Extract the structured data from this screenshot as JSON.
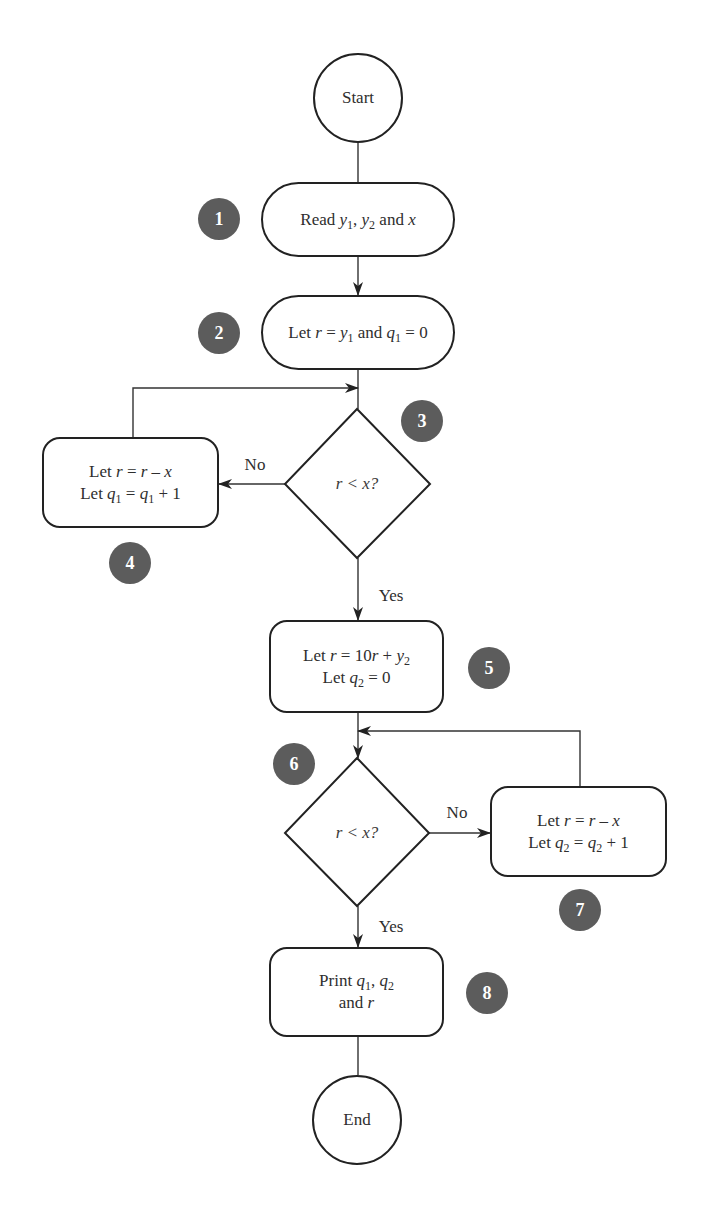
{
  "diagram": {
    "type": "flowchart",
    "colors": {
      "stroke": "#222222",
      "badge_fill": "#5c5c5c",
      "badge_text": "#ffffff",
      "text": "#2e2e2e"
    },
    "terminals": {
      "start": "Start",
      "end": "End"
    },
    "steps": {
      "s1": {
        "badge": "1",
        "prefix": "Read ",
        "v1": "y",
        "v1_sub": "1",
        "sep": ", ",
        "v2": "y",
        "v2_sub": "2",
        "suffix": " and ",
        "v3": "x"
      },
      "s2": {
        "badge": "2",
        "prefix": "Let ",
        "v1": "r",
        "eq": " = ",
        "v2": "y",
        "v2_sub": "1",
        "mid": " and ",
        "v3": "q",
        "v3_sub": "1",
        "suffix": " = 0"
      },
      "s3": {
        "badge": "3",
        "condition": "r < x?"
      },
      "s4": {
        "badge": "4",
        "line1": {
          "prefix": "Let ",
          "v1": "r",
          "eq": " = ",
          "v2": "r",
          "op": " – ",
          "v3": "x"
        },
        "line2": {
          "prefix": "Let ",
          "v1": "q",
          "v1_sub": "1",
          "eq": " = ",
          "v2": "q",
          "v2_sub": "1",
          "suffix": " + 1"
        }
      },
      "s5": {
        "badge": "5",
        "line1": {
          "prefix": "Let ",
          "v1": "r",
          "eq": " = 10",
          "v2": "r",
          "op": " + ",
          "v3": "y",
          "v3_sub": "2"
        },
        "line2": {
          "prefix": "Let ",
          "v1": "q",
          "v1_sub": "2",
          "suffix": " = 0"
        }
      },
      "s6": {
        "badge": "6",
        "condition": "r < x?"
      },
      "s7": {
        "badge": "7",
        "line1": {
          "prefix": "Let ",
          "v1": "r",
          "eq": " = ",
          "v2": "r",
          "op": " – ",
          "v3": "x"
        },
        "line2": {
          "prefix": "Let ",
          "v1": "q",
          "v1_sub": "2",
          "eq": " = ",
          "v2": "q",
          "v2_sub": "2",
          "suffix": " + 1"
        }
      },
      "s8": {
        "badge": "8",
        "line1": {
          "prefix": "Print ",
          "v1": "q",
          "v1_sub": "1",
          "sep": ", ",
          "v2": "q",
          "v2_sub": "2"
        },
        "line2": {
          "prefix": "and ",
          "v1": "r"
        }
      }
    },
    "edge_labels": {
      "d3_no": "No",
      "d3_yes": "Yes",
      "d6_no": "No",
      "d6_yes": "Yes"
    }
  }
}
